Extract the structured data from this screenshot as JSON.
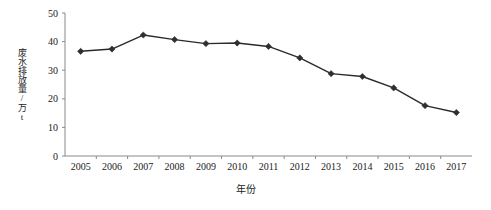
{
  "chart_data": {
    "type": "line",
    "title": "",
    "xlabel": "年份",
    "ylabel": "废水排放量/万t",
    "categories": [
      "2005",
      "2006",
      "2007",
      "2008",
      "2009",
      "2010",
      "2011",
      "2012",
      "2013",
      "2014",
      "2015",
      "2016",
      "2017"
    ],
    "values": [
      36.6,
      37.4,
      42.3,
      40.7,
      39.3,
      39.5,
      38.3,
      34.3,
      28.8,
      27.8,
      23.8,
      17.6,
      15.2
    ],
    "series": [
      {
        "name": "废水排放量",
        "values": [
          36.6,
          37.4,
          42.3,
          40.7,
          39.3,
          39.5,
          38.3,
          34.3,
          28.8,
          27.8,
          23.8,
          17.6,
          15.2
        ]
      }
    ],
    "ylim": [
      0,
      50
    ],
    "yticks": [
      0,
      10,
      20,
      30,
      40,
      50
    ],
    "ytick_labels": [
      "0",
      "10",
      "20",
      "30",
      "40",
      "50"
    ],
    "xtick_labels": [
      "2005",
      "2006",
      "2007",
      "2008",
      "2009",
      "2010",
      "2011",
      "2012",
      "2013",
      "2014",
      "2015",
      "2016",
      "2017"
    ],
    "grid": false,
    "legend": false,
    "legend_position": "none",
    "marker": "diamond",
    "line_color": "#2b2b2b",
    "marker_color": "#2f2f2f",
    "axis_color": "#8a8a8a",
    "background_color": "#ffffff"
  }
}
